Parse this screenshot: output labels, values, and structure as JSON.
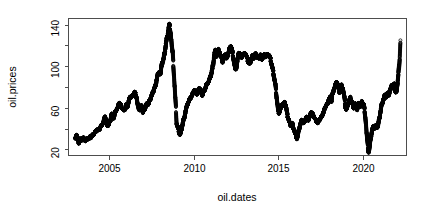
{
  "chart_data": {
    "type": "scatter",
    "title": "",
    "xlabel": "oil.dates",
    "ylabel": "oil.prices",
    "xlim": [
      2002.6,
      2022.6
    ],
    "ylim": [
      14,
      146
    ],
    "grid": false,
    "legend": null,
    "marker": "open-circle",
    "marker_color": "#000000",
    "xticks_major": [
      2005,
      2010,
      2015,
      2020
    ],
    "xtick_labels": [
      "2005",
      "2010",
      "2015",
      "2020"
    ],
    "yticks_major": [
      20,
      60,
      100,
      140
    ],
    "ytick_labels": [
      "20",
      "60",
      "100",
      "140"
    ],
    "yticks_minor": [
      40,
      80,
      120
    ],
    "series": [
      {
        "name": "oil.prices",
        "x": [
          2003.0,
          2003.04,
          2003.08,
          2003.12,
          2003.16,
          2003.2,
          2003.24,
          2003.28,
          2003.32,
          2003.36,
          2003.4,
          2003.44,
          2003.48,
          2003.52,
          2003.56,
          2003.6,
          2003.64,
          2003.68,
          2003.72,
          2003.76,
          2003.8,
          2003.84,
          2003.88,
          2003.92,
          2003.96,
          2004.0,
          2004.04,
          2004.08,
          2004.12,
          2004.16,
          2004.2,
          2004.24,
          2004.28,
          2004.32,
          2004.36,
          2004.4,
          2004.44,
          2004.48,
          2004.52,
          2004.56,
          2004.6,
          2004.64,
          2004.68,
          2004.72,
          2004.76,
          2004.8,
          2004.84,
          2004.88,
          2004.92,
          2004.96,
          2005.0,
          2005.04,
          2005.08,
          2005.12,
          2005.16,
          2005.2,
          2005.24,
          2005.28,
          2005.32,
          2005.36,
          2005.4,
          2005.44,
          2005.48,
          2005.52,
          2005.56,
          2005.6,
          2005.64,
          2005.68,
          2005.72,
          2005.76,
          2005.8,
          2005.84,
          2005.88,
          2005.92,
          2005.96,
          2006.0,
          2006.04,
          2006.08,
          2006.12,
          2006.16,
          2006.2,
          2006.24,
          2006.28,
          2006.32,
          2006.36,
          2006.4,
          2006.44,
          2006.48,
          2006.52,
          2006.56,
          2006.6,
          2006.64,
          2006.68,
          2006.72,
          2006.76,
          2006.8,
          2006.84,
          2006.88,
          2006.92,
          2006.96,
          2007.0,
          2007.04,
          2007.08,
          2007.12,
          2007.16,
          2007.2,
          2007.24,
          2007.28,
          2007.32,
          2007.36,
          2007.4,
          2007.44,
          2007.48,
          2007.52,
          2007.56,
          2007.6,
          2007.64,
          2007.68,
          2007.72,
          2007.76,
          2007.8,
          2007.84,
          2007.88,
          2007.92,
          2007.96,
          2008.0,
          2008.04,
          2008.08,
          2008.12,
          2008.16,
          2008.2,
          2008.24,
          2008.28,
          2008.32,
          2008.36,
          2008.4,
          2008.44,
          2008.48,
          2008.52,
          2008.56,
          2008.6,
          2008.64,
          2008.68,
          2008.72,
          2008.76,
          2008.8,
          2008.84,
          2008.88,
          2008.92,
          2008.96,
          2009.0,
          2009.04,
          2009.08,
          2009.12,
          2009.16,
          2009.2,
          2009.24,
          2009.28,
          2009.32,
          2009.36,
          2009.4,
          2009.44,
          2009.48,
          2009.52,
          2009.56,
          2009.6,
          2009.64,
          2009.68,
          2009.72,
          2009.76,
          2009.8,
          2009.84,
          2009.88,
          2009.92,
          2009.96,
          2010.0,
          2010.04,
          2010.08,
          2010.12,
          2010.16,
          2010.2,
          2010.24,
          2010.28,
          2010.32,
          2010.36,
          2010.4,
          2010.44,
          2010.48,
          2010.52,
          2010.56,
          2010.6,
          2010.64,
          2010.68,
          2010.72,
          2010.76,
          2010.8,
          2010.84,
          2010.88,
          2010.92,
          2010.96,
          2011.0,
          2011.04,
          2011.08,
          2011.12,
          2011.16,
          2011.2,
          2011.24,
          2011.28,
          2011.32,
          2011.36,
          2011.4,
          2011.44,
          2011.48,
          2011.52,
          2011.56,
          2011.6,
          2011.64,
          2011.68,
          2011.72,
          2011.76,
          2011.8,
          2011.84,
          2011.88,
          2011.92,
          2011.96,
          2012.0,
          2012.04,
          2012.08,
          2012.12,
          2012.16,
          2012.2,
          2012.24,
          2012.28,
          2012.32,
          2012.36,
          2012.4,
          2012.44,
          2012.48,
          2012.52,
          2012.56,
          2012.6,
          2012.64,
          2012.68,
          2012.72,
          2012.76,
          2012.8,
          2012.84,
          2012.88,
          2012.92,
          2012.96,
          2013.0,
          2013.04,
          2013.08,
          2013.12,
          2013.16,
          2013.2,
          2013.24,
          2013.28,
          2013.32,
          2013.36,
          2013.4,
          2013.44,
          2013.48,
          2013.52,
          2013.56,
          2013.6,
          2013.64,
          2013.68,
          2013.72,
          2013.76,
          2013.8,
          2013.84,
          2013.88,
          2013.92,
          2013.96,
          2014.0,
          2014.04,
          2014.08,
          2014.12,
          2014.16,
          2014.2,
          2014.24,
          2014.28,
          2014.32,
          2014.36,
          2014.4,
          2014.44,
          2014.48,
          2014.52,
          2014.56,
          2014.6,
          2014.64,
          2014.68,
          2014.72,
          2014.76,
          2014.8,
          2014.84,
          2014.88,
          2014.92,
          2014.96,
          2015.0,
          2015.04,
          2015.08,
          2015.12,
          2015.16,
          2015.2,
          2015.24,
          2015.28,
          2015.32,
          2015.36,
          2015.4,
          2015.44,
          2015.48,
          2015.52,
          2015.56,
          2015.6,
          2015.64,
          2015.68,
          2015.72,
          2015.76,
          2015.8,
          2015.84,
          2015.88,
          2015.92,
          2015.96,
          2016.0,
          2016.04,
          2016.08,
          2016.12,
          2016.16,
          2016.2,
          2016.24,
          2016.28,
          2016.32,
          2016.36,
          2016.4,
          2016.44,
          2016.48,
          2016.52,
          2016.56,
          2016.6,
          2016.64,
          2016.68,
          2016.72,
          2016.76,
          2016.8,
          2016.84,
          2016.88,
          2016.92,
          2016.96,
          2017.0,
          2017.04,
          2017.08,
          2017.12,
          2017.16,
          2017.2,
          2017.24,
          2017.28,
          2017.32,
          2017.36,
          2017.4,
          2017.44,
          2017.48,
          2017.52,
          2017.56,
          2017.6,
          2017.64,
          2017.68,
          2017.72,
          2017.76,
          2017.8,
          2017.84,
          2017.88,
          2017.92,
          2017.96,
          2018.0,
          2018.04,
          2018.08,
          2018.12,
          2018.16,
          2018.2,
          2018.24,
          2018.28,
          2018.32,
          2018.36,
          2018.4,
          2018.44,
          2018.48,
          2018.52,
          2018.56,
          2018.6,
          2018.64,
          2018.68,
          2018.72,
          2018.76,
          2018.8,
          2018.84,
          2018.88,
          2018.92,
          2018.96,
          2019.0,
          2019.04,
          2019.08,
          2019.12,
          2019.16,
          2019.2,
          2019.24,
          2019.28,
          2019.32,
          2019.36,
          2019.4,
          2019.44,
          2019.48,
          2019.52,
          2019.56,
          2019.6,
          2019.64,
          2019.68,
          2019.72,
          2019.76,
          2019.8,
          2019.84,
          2019.88,
          2019.92,
          2019.96,
          2020.0,
          2020.04,
          2020.08,
          2020.12,
          2020.16,
          2020.2,
          2020.24,
          2020.28,
          2020.32,
          2020.36,
          2020.4,
          2020.44,
          2020.48,
          2020.52,
          2020.56,
          2020.6,
          2020.64,
          2020.68,
          2020.72,
          2020.76,
          2020.8,
          2020.84,
          2020.88,
          2020.92,
          2020.96,
          2021.0,
          2021.04,
          2021.08,
          2021.12,
          2021.16,
          2021.2,
          2021.24,
          2021.28,
          2021.32,
          2021.36,
          2021.4,
          2021.44,
          2021.48,
          2021.52,
          2021.56,
          2021.6,
          2021.64,
          2021.68,
          2021.72,
          2021.76,
          2021.8,
          2021.84,
          2021.88,
          2021.92,
          2021.96,
          2022.0,
          2022.04,
          2022.08,
          2022.12,
          2022.16,
          2022.2,
          2022.24
        ],
        "y": [
          31,
          33,
          34,
          32,
          28,
          26,
          27,
          28,
          29,
          30,
          29,
          30,
          31,
          30,
          29,
          28,
          29,
          30,
          30,
          31,
          30,
          31,
          32,
          31,
          32,
          33,
          34,
          34,
          35,
          36,
          37,
          38,
          39,
          38,
          39,
          40,
          39,
          41,
          42,
          43,
          44,
          45,
          46,
          50,
          52,
          49,
          47,
          44,
          43,
          43,
          45,
          47,
          48,
          52,
          54,
          53,
          51,
          50,
          53,
          55,
          57,
          58,
          59,
          60,
          63,
          65,
          64,
          63,
          61,
          60,
          59,
          58,
          57,
          58,
          59,
          63,
          62,
          61,
          63,
          66,
          68,
          70,
          71,
          70,
          71,
          72,
          73,
          74,
          75,
          74,
          72,
          69,
          64,
          60,
          59,
          58,
          59,
          60,
          62,
          61,
          55,
          57,
          58,
          59,
          61,
          63,
          64,
          65,
          63,
          65,
          67,
          68,
          70,
          72,
          73,
          75,
          77,
          79,
          80,
          82,
          86,
          89,
          92,
          93,
          95,
          94,
          92,
          96,
          101,
          104,
          105,
          108,
          112,
          116,
          121,
          125,
          128,
          132,
          136,
          140,
          138,
          133,
          126,
          118,
          112,
          102,
          92,
          80,
          68,
          58,
          45,
          42,
          41,
          38,
          35,
          34,
          36,
          39,
          42,
          45,
          48,
          50,
          53,
          56,
          59,
          61,
          63,
          65,
          66,
          68,
          69,
          70,
          71,
          72,
          74,
          76,
          77,
          76,
          75,
          74,
          73,
          74,
          76,
          78,
          79,
          77,
          75,
          74,
          72,
          74,
          76,
          77,
          78,
          80,
          82,
          83,
          84,
          85,
          86,
          88,
          90,
          92,
          95,
          98,
          102,
          108,
          112,
          115,
          113,
          110,
          112,
          114,
          116,
          115,
          112,
          110,
          108,
          106,
          104,
          106,
          108,
          110,
          112,
          109,
          107,
          110,
          112,
          114,
          116,
          118,
          120,
          118,
          115,
          112,
          108,
          104,
          100,
          96,
          98,
          102,
          106,
          110,
          112,
          113,
          112,
          110,
          109,
          111,
          112,
          110,
          112,
          113,
          112,
          110,
          108,
          106,
          104,
          103,
          102,
          104,
          106,
          108,
          110,
          109,
          108,
          110,
          111,
          112,
          110,
          109,
          108,
          107,
          108,
          110,
          111,
          108,
          107,
          108,
          109,
          110,
          111,
          110,
          109,
          110,
          111,
          112,
          111,
          110,
          108,
          106,
          103,
          100,
          97,
          94,
          90,
          86,
          82,
          76,
          70,
          64,
          58,
          55,
          56,
          58,
          60,
          62,
          64,
          63,
          62,
          64,
          65,
          63,
          60,
          56,
          52,
          50,
          48,
          46,
          44,
          43,
          44,
          45,
          43,
          40,
          38,
          36,
          34,
          32,
          30,
          33,
          36,
          39,
          42,
          44,
          46,
          48,
          47,
          46,
          45,
          47,
          48,
          50,
          51,
          50,
          49,
          48,
          50,
          52,
          54,
          56,
          55,
          54,
          53,
          52,
          50,
          49,
          48,
          47,
          46,
          45,
          47,
          48,
          49,
          50,
          51,
          52,
          54,
          55,
          57,
          59,
          61,
          62,
          63,
          64,
          66,
          68,
          69,
          70,
          68,
          66,
          72,
          74,
          76,
          78,
          80,
          82,
          84,
          85,
          83,
          80,
          77,
          75,
          78,
          80,
          82,
          80,
          78,
          74,
          70,
          65,
          60,
          58,
          60,
          62,
          64,
          66,
          68,
          70,
          68,
          66,
          64,
          62,
          60,
          62,
          64,
          62,
          60,
          58,
          62,
          64,
          63,
          62,
          61,
          64,
          66,
          65,
          64,
          62,
          58,
          52,
          45,
          35,
          28,
          22,
          17,
          20,
          25,
          30,
          34,
          38,
          40,
          42,
          41,
          40,
          42,
          43,
          42,
          41,
          43,
          47,
          50,
          54,
          58,
          62,
          64,
          66,
          68,
          70,
          72,
          71,
          70,
          72,
          74,
          73,
          72,
          75,
          78,
          80,
          82,
          81,
          80,
          82,
          84,
          78,
          74,
          76,
          80,
          85,
          92,
          100,
          110,
          125
        ]
      }
    ]
  },
  "axes": {
    "x_label": "oil.dates",
    "y_label": "oil.prices"
  }
}
